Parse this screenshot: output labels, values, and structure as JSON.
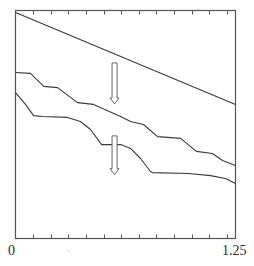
{
  "chart_data": {
    "type": "line",
    "title": "",
    "xlabel": "",
    "ylabel": "",
    "xlim": [
      0,
      1.25
    ],
    "ylim": [
      0,
      1
    ],
    "grid": false,
    "legend": null,
    "x_tick_labels": [
      "0",
      "1.25"
    ],
    "x_minor_ticks": [
      0.1,
      0.2,
      0.3,
      0.4,
      0.5,
      0.6,
      0.7,
      0.8,
      0.9,
      1.0,
      1.1,
      1.2
    ],
    "annotations": [
      {
        "type": "hollow-arrow-down",
        "x": 0.56,
        "y_from": 0.77,
        "y_to": 0.59,
        "note": "from top line to middle curve"
      },
      {
        "type": "hollow-arrow-down",
        "x": 0.56,
        "y_from": 0.45,
        "y_to": 0.28,
        "note": "from middle curve to bottom curve"
      }
    ],
    "series": [
      {
        "name": "top-linear",
        "style": "straight line",
        "x": [
          0,
          1.25
        ],
        "y": [
          0.991,
          0.588
        ]
      },
      {
        "name": "middle-staircase",
        "style": "smoothed staircase",
        "x": [
          0,
          0.085,
          0.16,
          0.239,
          0.352,
          0.443,
          0.597,
          0.654,
          0.727,
          0.807,
          0.938,
          1.028,
          1.119,
          1.176,
          1.25
        ],
        "y": [
          0.728,
          0.724,
          0.667,
          0.662,
          0.596,
          0.588,
          0.535,
          0.513,
          0.5,
          0.447,
          0.439,
          0.382,
          0.373,
          0.342,
          0.32
        ]
      },
      {
        "name": "bottom-staircase",
        "style": "smoothed staircase",
        "x": [
          0,
          0.057,
          0.102,
          0.153,
          0.295,
          0.369,
          0.426,
          0.489,
          0.597,
          0.654,
          0.71,
          0.767,
          0.778,
          0.983,
          1.108,
          1.193,
          1.25
        ],
        "y": [
          0.64,
          0.588,
          0.539,
          0.535,
          0.531,
          0.513,
          0.478,
          0.412,
          0.412,
          0.395,
          0.351,
          0.294,
          0.289,
          0.285,
          0.276,
          0.263,
          0.241
        ]
      }
    ]
  },
  "axis": {
    "x_min_label": "0",
    "x_max_label": "1.25"
  },
  "colors": {
    "frame": "#555555",
    "line": "#3a3a3a",
    "arrow": "#666666",
    "background": "#ffffff"
  }
}
